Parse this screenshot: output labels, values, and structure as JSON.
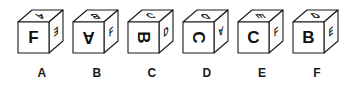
{
  "figure": {
    "type": "cube-net-rotation-puzzle",
    "background_color": "#ffffff",
    "outline_color": "#1a1a1a",
    "letter_color": "#111111",
    "cube_count": 6
  },
  "cubes": [
    {
      "label": "A",
      "front": {
        "letter": "F",
        "rotation_deg": 0
      },
      "top": {
        "letter": "A",
        "rotation_deg": 180
      },
      "right": {
        "letter": "E",
        "rotation_deg": 180
      }
    },
    {
      "label": "B",
      "front": {
        "letter": "A",
        "rotation_deg": 180
      },
      "top": {
        "letter": "B",
        "rotation_deg": 180
      },
      "right": {
        "letter": "F",
        "rotation_deg": 0
      }
    },
    {
      "label": "C",
      "front": {
        "letter": "B",
        "rotation_deg": 90
      },
      "top": {
        "letter": "C",
        "rotation_deg": 0
      },
      "right": {
        "letter": "D",
        "rotation_deg": 0
      }
    },
    {
      "label": "D",
      "front": {
        "letter": "C",
        "rotation_deg": 90
      },
      "top": {
        "letter": "D",
        "rotation_deg": 180
      },
      "right": {
        "letter": "A",
        "rotation_deg": 180
      }
    },
    {
      "label": "E",
      "front": {
        "letter": "C",
        "rotation_deg": 0
      },
      "top": {
        "letter": "E",
        "rotation_deg": 90
      },
      "right": {
        "letter": "F",
        "rotation_deg": 0
      }
    },
    {
      "label": "F",
      "front": {
        "letter": "B",
        "rotation_deg": 0
      },
      "top": {
        "letter": "D",
        "rotation_deg": 0
      },
      "right": {
        "letter": "E",
        "rotation_deg": 0
      }
    }
  ],
  "layout": {
    "slot_left_positions": [
      14,
      69,
      124,
      179,
      234,
      289
    ]
  }
}
